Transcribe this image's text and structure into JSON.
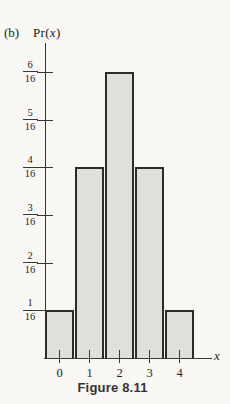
{
  "figure": {
    "panel_label": "(b)",
    "y_axis_title_pre": "Pr(",
    "y_axis_title_var": "x",
    "y_axis_title_post": ")",
    "x_axis_label": "x",
    "caption": "Figure 8.11"
  },
  "chart_data": {
    "type": "bar",
    "title": "",
    "xlabel": "x",
    "ylabel": "Pr(x)",
    "categories": [
      "0",
      "1",
      "2",
      "3",
      "4"
    ],
    "values": [
      0.0625,
      0.25,
      0.375,
      0.25,
      0.0625
    ],
    "values_sixteenths": [
      1,
      4,
      6,
      4,
      1
    ],
    "y_ticks": [
      {
        "numerator": "1",
        "denominator": "16",
        "value": 1
      },
      {
        "numerator": "2",
        "denominator": "16",
        "value": 2
      },
      {
        "numerator": "3",
        "denominator": "16",
        "value": 3
      },
      {
        "numerator": "4",
        "denominator": "16",
        "value": 4
      },
      {
        "numerator": "5",
        "denominator": "16",
        "value": 5
      },
      {
        "numerator": "6",
        "denominator": "16",
        "value": 6
      }
    ],
    "ylim": [
      0,
      0.4125
    ],
    "grid": false,
    "legend": false,
    "bar_gap": "adjacent bars, each outlined"
  },
  "colors": {
    "background": "#f9f8f4",
    "bar_fill": "#e0dfdc",
    "bar_border": "#2d2b28",
    "axis": "#3a3834",
    "text": "#201f1d"
  }
}
